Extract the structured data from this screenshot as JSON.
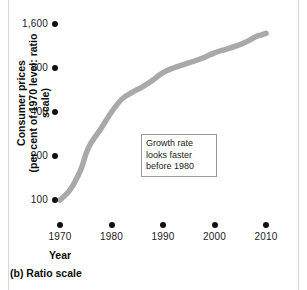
{
  "chart_data": {
    "type": "line",
    "title": "",
    "caption": "(b) Ratio scale",
    "xlabel": "Year",
    "ylabel": "Consumer prices (per cent of 1970 level: ratio scale)",
    "ylabel_lines": [
      "Consumer prices",
      "(per cent of 1970 level: ratio scale)"
    ],
    "yscale": "log",
    "ylim": [
      100,
      1600
    ],
    "xlim": [
      1970,
      2010
    ],
    "grid": false,
    "legend": "none",
    "xticks": [
      1970,
      1980,
      1990,
      2000,
      2010
    ],
    "xtick_labels": [
      "1970",
      "1980",
      "1990",
      "2000",
      "2010"
    ],
    "yticks": [
      100,
      200,
      400,
      800,
      1600
    ],
    "ytick_labels": [
      "100",
      "200",
      "400",
      "800",
      "1,600"
    ],
    "series": [
      {
        "name": "Consumer prices",
        "color": "#a9a9a9",
        "x": [
          1970,
          1972,
          1974,
          1975,
          1976,
          1978,
          1980,
          1982,
          1984,
          1986,
          1988,
          1990,
          1992,
          1994,
          1996,
          1998,
          2000,
          2002,
          2004,
          2006,
          2008,
          2009,
          2010
        ],
        "values": [
          100,
          118,
          160,
          205,
          245,
          310,
          400,
          490,
          545,
          595,
          660,
          745,
          800,
          845,
          890,
          945,
          1015,
          1070,
          1125,
          1200,
          1310,
          1345,
          1380
        ]
      }
    ],
    "annotations": [
      {
        "text": "Growth rate looks faster before 1980",
        "lines": [
          "Growth rate",
          "looks faster",
          "before 1980"
        ]
      }
    ]
  },
  "colors": {
    "line": "#a9a9a9",
    "marker": "#111111",
    "text": "#1a1a1a",
    "rule": "#d8d8d8",
    "annotation_border": "#9a9a9a",
    "background": "#ffffff"
  }
}
